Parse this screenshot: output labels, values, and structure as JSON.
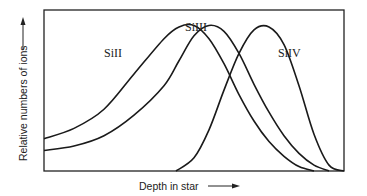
{
  "chart_data": {
    "type": "line",
    "title": "",
    "xlabel": "Depth in star",
    "ylabel": "Relative numbers of ions",
    "xlim": [
      0,
      100
    ],
    "ylim": [
      0,
      100
    ],
    "grid": false,
    "axis_ticks": false,
    "series": [
      {
        "name": "SiII",
        "label": "SiII",
        "x": [
          0,
          10,
          20,
          30,
          40,
          45,
          50,
          55,
          60,
          65,
          70,
          75,
          80,
          85,
          90,
          95,
          100
        ],
        "y": [
          22,
          29,
          42,
          66,
          90,
          98,
          99,
          90,
          73,
          52,
          34,
          20,
          10,
          3,
          0,
          null,
          null
        ]
      },
      {
        "name": "SiIII",
        "label": "SiIII",
        "x": [
          0,
          10,
          20,
          30,
          40,
          45,
          50,
          55,
          60,
          65,
          70,
          75,
          80,
          85,
          90,
          95,
          100
        ],
        "y": [
          14,
          17,
          24,
          38,
          58,
          75,
          92,
          99,
          95,
          80,
          59,
          40,
          24,
          12,
          4,
          0,
          null
        ]
      },
      {
        "name": "SiIV",
        "label": "SiIV",
        "x": [
          44,
          50,
          55,
          60,
          65,
          70,
          75,
          80,
          85,
          90,
          95,
          100
        ],
        "y": [
          0,
          9,
          28,
          55,
          80,
          96,
          98,
          86,
          58,
          25,
          4,
          0
        ]
      }
    ],
    "legend": "inline labels near peaks"
  }
}
